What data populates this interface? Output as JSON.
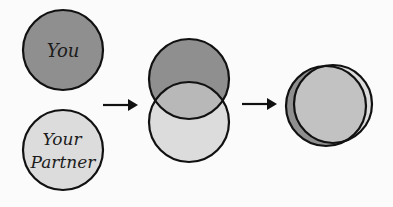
{
  "diagram": {
    "circles": {
      "you": {
        "label": "You",
        "fill": "#8f8f8f"
      },
      "partner": {
        "label_line1": "Your",
        "label_line2": "Partner",
        "fill": "#dcdcdc"
      },
      "overlap_fill": "#b8b8b8",
      "merged_fill": "#c2c2c2"
    },
    "stroke": "#111111",
    "background": "#fbfbfb"
  }
}
